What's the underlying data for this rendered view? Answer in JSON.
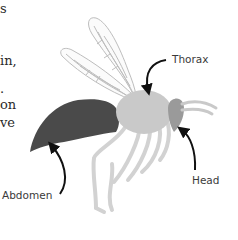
{
  "text_fragments": [
    {
      "text": "s",
      "top": 2
    },
    {
      "text": "in,",
      "top": 54
    },
    {
      "text": ".",
      "top": 82
    },
    {
      "text": "on",
      "top": 98
    },
    {
      "text": "ve",
      "top": 116
    }
  ],
  "labels": {
    "thorax": "Thorax",
    "head": "Head",
    "abdomen": "Abdomen"
  },
  "colors": {
    "abdomen": "#4a4a4a",
    "thorax": "#c9c9c9",
    "head": "#9a9a9a",
    "legs": "#d2d2d2",
    "wing_vein": "#bdbdbd",
    "arrow": "#111111"
  }
}
